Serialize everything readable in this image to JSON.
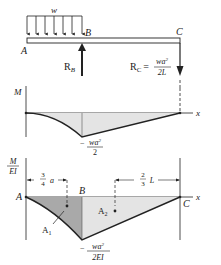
{
  "beam": {
    "load_label": "w",
    "point_a": "A",
    "point_b": "B",
    "point_c": "C",
    "reaction_b": "R",
    "reaction_b_sub": "B",
    "reaction_c": "R",
    "reaction_c_sub": "C",
    "reaction_c_eq": "=",
    "reaction_c_num": "wa",
    "reaction_c_num_exp": "2",
    "reaction_c_den": "2L"
  },
  "moment_diagram": {
    "y_label": "M",
    "x_label": "x",
    "min_label_sign": "−",
    "min_label_num": "wa",
    "min_label_exp": "2",
    "min_label_den": "2"
  },
  "curvature_diagram": {
    "y_label_num": "M",
    "y_label_den": "EI",
    "x_label": "x",
    "point_a": "A",
    "point_b": "B",
    "point_c": "C",
    "dim_left_num": "3",
    "dim_left_den": "4",
    "dim_left_var": "a",
    "dim_right_num": "2",
    "dim_right_den": "3",
    "dim_right_var": "L",
    "area_1": "A",
    "area_1_sub": "1",
    "area_2": "A",
    "area_2_sub": "2",
    "min_label_sign": "−",
    "min_label_num": "wa",
    "min_label_exp": "2",
    "min_label_den": "2EI"
  },
  "colors": {
    "line": "#222222",
    "shade_light": "#e4e4e4",
    "shade_dark": "#a9a9a9"
  }
}
